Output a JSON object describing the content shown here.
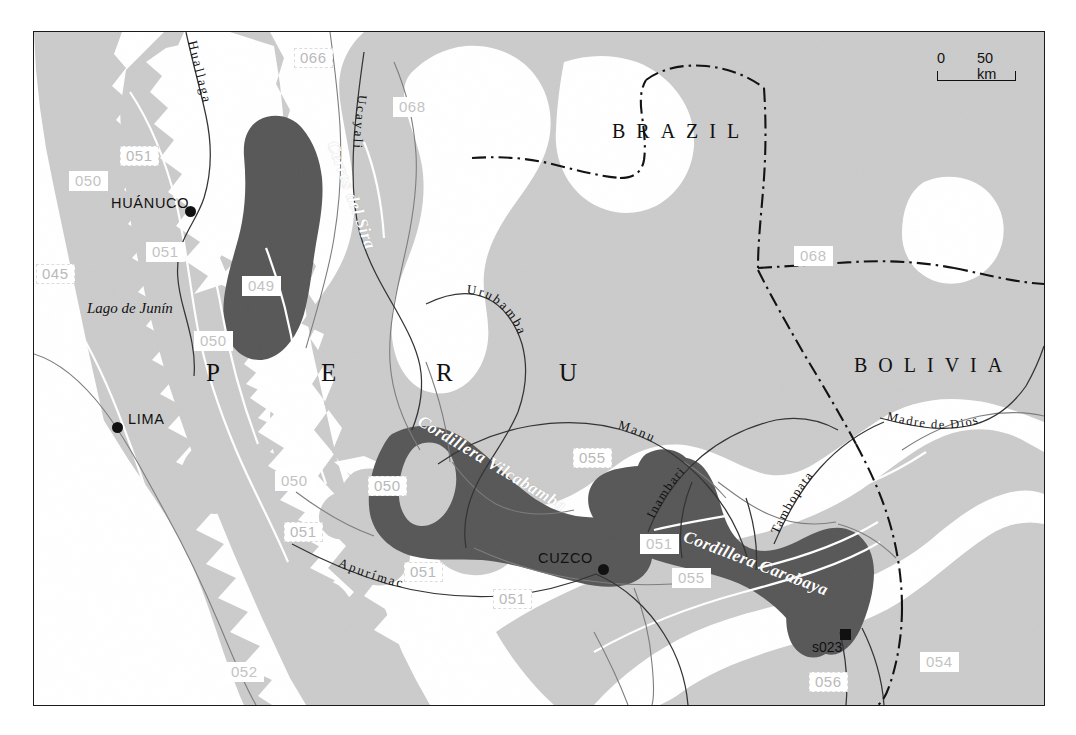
{
  "map": {
    "title": "Peru - Bolivia - Brazil borderland relief map",
    "colors": {
      "light_gray": "#cbcbcb",
      "dark_gray": "#585858",
      "white": "#ffffff",
      "outline": "#6e6e6e",
      "border_line": "#1a1a1a",
      "code_text": "#bcbcbc"
    },
    "scalebar": {
      "zero": "0",
      "max": "50 km"
    },
    "countries": [
      {
        "name": "BRAZIL",
        "x": 614,
        "y": 100
      },
      {
        "name": "BOLIVIA",
        "x": 855,
        "y": 335
      }
    ],
    "country_peru": {
      "letters": [
        {
          "ch": "P",
          "x": 205,
          "y": 340
        },
        {
          "ch": "E",
          "x": 320,
          "y": 340
        },
        {
          "ch": "R",
          "x": 435,
          "y": 340
        },
        {
          "ch": "U",
          "x": 558,
          "y": 340
        }
      ]
    },
    "cities": [
      {
        "name": "HUÁNUCO",
        "label_x": 110,
        "label_y": 193,
        "dot_x": 184,
        "dot_y": 205
      },
      {
        "name": "LIMA",
        "label_x": 127,
        "label_y": 409,
        "dot_x": 111,
        "dot_y": 420
      },
      {
        "name": "CUZCO",
        "label_x": 537,
        "label_y": 548,
        "dot_x": 597,
        "dot_y": 562
      }
    ],
    "sites": [
      {
        "name": "s023",
        "label_x": 811,
        "label_y": 636,
        "sq_x": 839,
        "sq_y": 627
      }
    ],
    "lakes": [
      {
        "name": "Lago de Junín",
        "x": 86,
        "y": 298
      }
    ],
    "ranges": [
      {
        "name": "Cerros del Sira",
        "x": 331,
        "y": 132,
        "rotate": 70,
        "size": 17
      },
      {
        "name": "Cordillera Vilcabamba",
        "x": 418,
        "y": 408,
        "rotate": 31,
        "size": 17
      },
      {
        "name": "Cordillera Carabaya",
        "x": 683,
        "y": 524,
        "rotate": 21,
        "size": 17
      }
    ],
    "rivers": [
      {
        "name": "Huallaga"
      },
      {
        "name": "Ucayali"
      },
      {
        "name": "Urubamba"
      },
      {
        "name": "Manu"
      },
      {
        "name": "Apurímac"
      },
      {
        "name": "Inambari"
      },
      {
        "name": "Tambopata"
      },
      {
        "name": "Madre de Dios"
      }
    ],
    "codes": [
      {
        "v": "066",
        "x": 293,
        "y": 47,
        "style": "dashed"
      },
      {
        "v": "068",
        "x": 392,
        "y": 96,
        "style": "solid"
      },
      {
        "v": "051",
        "x": 119,
        "y": 145,
        "style": "dashed"
      },
      {
        "v": "050",
        "x": 68,
        "y": 170,
        "style": "solid"
      },
      {
        "v": "051",
        "x": 145,
        "y": 241,
        "style": "solid"
      },
      {
        "v": "045",
        "x": 35,
        "y": 263,
        "style": "dashed"
      },
      {
        "v": "049",
        "x": 241,
        "y": 275,
        "style": "solid"
      },
      {
        "v": "050",
        "x": 193,
        "y": 330,
        "style": "solid"
      },
      {
        "v": "068",
        "x": 793,
        "y": 245,
        "style": "solid"
      },
      {
        "v": "055",
        "x": 572,
        "y": 447,
        "style": "dashed"
      },
      {
        "v": "050",
        "x": 274,
        "y": 470,
        "style": "solid"
      },
      {
        "v": "050",
        "x": 367,
        "y": 475,
        "style": "dashed"
      },
      {
        "v": "051",
        "x": 283,
        "y": 521,
        "style": "dashed"
      },
      {
        "v": "051",
        "x": 639,
        "y": 533,
        "style": "solid"
      },
      {
        "v": "051",
        "x": 403,
        "y": 561,
        "style": "dashed"
      },
      {
        "v": "055",
        "x": 671,
        "y": 567,
        "style": "solid"
      },
      {
        "v": "051",
        "x": 492,
        "y": 588,
        "style": "dashed"
      },
      {
        "v": "052",
        "x": 224,
        "y": 661,
        "style": "solid"
      },
      {
        "v": "054",
        "x": 919,
        "y": 651,
        "style": "solid"
      },
      {
        "v": "056",
        "x": 808,
        "y": 671,
        "style": "dashed"
      }
    ]
  }
}
